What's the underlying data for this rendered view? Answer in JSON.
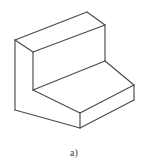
{
  "figure": {
    "caption": "a)",
    "projection": "isometric",
    "line_color": "#4a4a4a",
    "fill_color": "#ffffff",
    "background_color": "#ffffff",
    "line_width": "1.15",
    "canvas": {
      "width": 148,
      "height": 165,
      "drawing_height": 140
    },
    "geometry": {
      "vertices": {
        "wall_top_back_apex": "87,12",
        "wall_top_left": "15,40",
        "wall_top_front_inner": "33,52",
        "wall_top_right_lower": "105,25",
        "wall_left_bottom": "15,95",
        "wall_inner_bottom": "33,90",
        "base_top_right": "134,85",
        "base_front_bottom": "80,128",
        "base_right_bottom": "134,100",
        "base_left_front": "15,95",
        "base_inner_front_corner": "80,113"
      },
      "faces": [
        {
          "name": "upper-slab-top-face",
          "points": "15,40 87,12 105,25 33,52"
        },
        {
          "name": "upper-slab-front-face",
          "points": "33,52 105,25 105,61 33,90"
        },
        {
          "name": "upper-slab-left-face",
          "points": "15,40 33,52 33,90 15,95"
        },
        {
          "name": "base-top-face",
          "points": "33,90 105,61 134,85 80,113"
        },
        {
          "name": "base-front-left-face",
          "points": "15,95 80,113 80,128 15,110"
        },
        {
          "name": "base-front-right-face",
          "points": "80,113 134,85 134,100 80,128"
        }
      ],
      "edges": [
        {
          "name": "top-back-left-edge",
          "path": "M15,40 L87,12"
        },
        {
          "name": "top-back-right-edge",
          "path": "M87,12 L105,25"
        },
        {
          "name": "top-front-right-edge",
          "path": "M105,25 L33,52"
        },
        {
          "name": "top-front-left-edge",
          "path": "M33,52 L15,40"
        },
        {
          "name": "wall-right-vertical-edge",
          "path": "M105,25 L105,61"
        },
        {
          "name": "wall-left-outer-vertical-edge",
          "path": "M15,40 L15,110"
        },
        {
          "name": "wall-inner-vertical-edge",
          "path": "M33,52 L33,90"
        },
        {
          "name": "base-top-back-edge",
          "path": "M105,61 L134,85"
        },
        {
          "name": "base-top-inner-edge",
          "path": "M33,90 L105,61"
        },
        {
          "name": "base-top-front-edge",
          "path": "M33,90 L80,113"
        },
        {
          "name": "base-top-front-right-edge",
          "path": "M80,113 L134,85"
        },
        {
          "name": "base-right-vertical-edge",
          "path": "M134,85 L134,100"
        },
        {
          "name": "base-front-vertical-edge",
          "path": "M80,113 L80,128"
        },
        {
          "name": "base-bottom-left-edge",
          "path": "M15,110 L80,128"
        },
        {
          "name": "base-bottom-right-edge",
          "path": "M80,128 L134,100"
        }
      ]
    }
  }
}
